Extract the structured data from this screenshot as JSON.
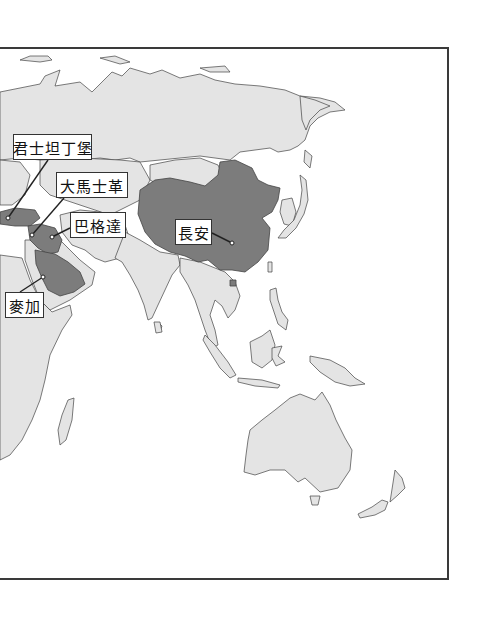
{
  "map": {
    "region": "Asia and surrounding regions",
    "colors": {
      "land": "#e4e4e4",
      "highlight": "#7c7c7c",
      "border": "#444444",
      "sea": "#ffffff",
      "frame": "#3a3a3a",
      "label_bg": "#ffffff"
    },
    "highlighted_regions": [
      "China",
      "Turkey/Anatolia",
      "Iraq",
      "Arabian Peninsula"
    ],
    "cities": [
      {
        "id": "constantinople",
        "label": "君士坦丁堡",
        "box": [
          13,
          134,
          79,
          26
        ],
        "point": [
          8,
          218
        ]
      },
      {
        "id": "damascus",
        "label": "大馬士革",
        "box": [
          56,
          172,
          72,
          26
        ],
        "point": [
          32,
          235
        ]
      },
      {
        "id": "baghdad",
        "label": "巴格達",
        "box": [
          70,
          212,
          56,
          26
        ],
        "point": [
          52,
          237
        ]
      },
      {
        "id": "changan",
        "label": "長安",
        "box": [
          175,
          219,
          37,
          26
        ],
        "point": [
          232,
          243
        ]
      },
      {
        "id": "mecca",
        "label": "麥加",
        "box": [
          5,
          292,
          39,
          26
        ],
        "point": [
          43,
          277
        ]
      }
    ]
  }
}
